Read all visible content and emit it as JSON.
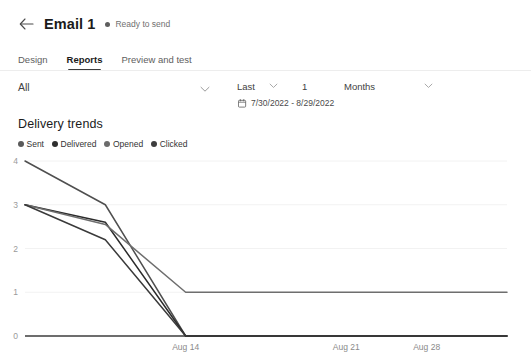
{
  "header": {
    "back_icon": "arrow-left-icon",
    "title": "Email 1",
    "status_text": "Ready to send"
  },
  "tabs": [
    {
      "label": "Design",
      "active": false
    },
    {
      "label": "Reports",
      "active": true
    },
    {
      "label": "Preview and test",
      "active": false
    }
  ],
  "filters": {
    "audience_value": "All",
    "audience_chevron_icon": "chevron-down-icon",
    "range_mode": "Last",
    "range_mode_chevron_icon": "chevron-down-icon",
    "range_amount": "1",
    "range_units": "Months",
    "range_units_chevron_icon": "chevron-down-icon",
    "calendar_icon": "calendar-icon",
    "date_range": "7/30/2022 - 8/29/2022"
  },
  "chart_data": {
    "type": "line",
    "title": "Delivery trends",
    "xlabel": "",
    "ylabel": "",
    "ylim": [
      0,
      4
    ],
    "yticks": [
      0,
      1,
      2,
      3,
      4
    ],
    "xticks": [
      "Aug 14",
      "Aug 21",
      "Aug 28"
    ],
    "grid": true,
    "legend_position": "top-left",
    "x": [
      "Aug 12",
      "Aug 13",
      "Aug 14",
      "Aug 16",
      "Aug 21",
      "Aug 28",
      "Aug 29"
    ],
    "series": [
      {
        "name": "Sent",
        "color": "#4f4f4f",
        "values": [
          4,
          3,
          0,
          0,
          0,
          0,
          0
        ]
      },
      {
        "name": "Delivered",
        "color": "#2b2b2b",
        "values": [
          3,
          2.6,
          0,
          0,
          0,
          0,
          0
        ]
      },
      {
        "name": "Opened",
        "color": "#6e6e6e",
        "values": [
          3,
          2.55,
          1,
          1,
          1,
          1,
          1
        ]
      },
      {
        "name": "Clicked",
        "color": "#3a3a3a",
        "values": [
          3,
          2.2,
          0,
          0,
          0,
          0,
          0
        ]
      }
    ],
    "legend": [
      {
        "label": "Sent",
        "color": "#5a5a5a"
      },
      {
        "label": "Delivered",
        "color": "#2e2e2e"
      },
      {
        "label": "Opened",
        "color": "#6b6b6b"
      },
      {
        "label": "Clicked",
        "color": "#3d3d3d"
      }
    ]
  }
}
